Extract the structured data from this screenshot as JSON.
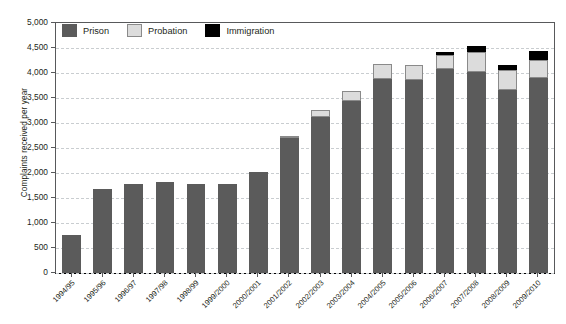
{
  "chart_data": {
    "type": "bar",
    "stacked": true,
    "title": "",
    "xlabel": "",
    "ylabel": "Complaints received per year",
    "ylim": [
      0,
      5000
    ],
    "ytick_step": 500,
    "yticks": [
      "5,000",
      "4,500",
      "4,000",
      "3,500",
      "3,000",
      "2,500",
      "2,000",
      "1,500",
      "1,000",
      "500",
      "0"
    ],
    "grid": true,
    "legend_position": "top-left-inside",
    "categories": [
      "1994/95",
      "1995/96",
      "1996/97",
      "1997/98",
      "1998/99",
      "1999/2000",
      "2000/2001",
      "2001/2002",
      "2002/2003",
      "2003/2004",
      "2004/2005",
      "2005/2006",
      "2006/2007",
      "2007/2008",
      "2008/2009",
      "2009/2010"
    ],
    "series": [
      {
        "name": "Prison",
        "color": "#5b5b5b",
        "values": [
          770,
          1680,
          1790,
          1830,
          1780,
          1780,
          2030,
          2700,
          3130,
          3450,
          3880,
          3860,
          4080,
          4030,
          3670,
          3900
        ]
      },
      {
        "name": "Probation",
        "color": "#dcdcdc",
        "values": [
          0,
          0,
          0,
          0,
          0,
          0,
          0,
          40,
          130,
          200,
          300,
          300,
          290,
          390,
          400,
          370
        ]
      },
      {
        "name": "Immigration",
        "color": "#000000",
        "values": [
          0,
          0,
          0,
          0,
          0,
          0,
          0,
          0,
          0,
          0,
          0,
          0,
          60,
          120,
          100,
          170
        ]
      }
    ],
    "totals": [
      770,
      1680,
      1790,
      1830,
      1780,
      1780,
      2030,
      2740,
      3260,
      3650,
      4180,
      4160,
      4430,
      4540,
      4170,
      4440
    ]
  },
  "legend": {
    "items": [
      {
        "label": "Prison",
        "swatch": "legend-swatch-prison"
      },
      {
        "label": "Probation",
        "swatch": "legend-swatch-probation"
      },
      {
        "label": "Immigration",
        "swatch": "legend-swatch-immigration"
      }
    ]
  },
  "colors": {
    "prison": "#5b5b5b",
    "probation": "#dcdcdc",
    "immigration": "#000000",
    "axis": "#58595b",
    "grid": "#c9cdd0",
    "text": "#231f20"
  }
}
